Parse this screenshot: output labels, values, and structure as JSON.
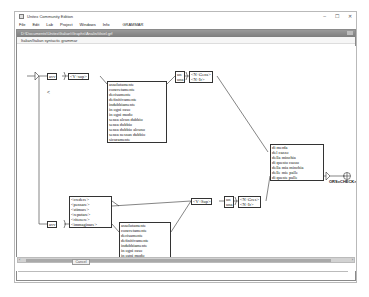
{
  "app": {
    "title": "Unitex Community Edition",
    "window_controls": {
      "minimize": "–",
      "maximize": "☐",
      "close": "✕"
    }
  },
  "menubar": {
    "items": [
      "File",
      "Edit",
      "Lab",
      "Project",
      "Windows",
      "Info",
      "GRAMMAR"
    ]
  },
  "frame": {
    "title": "D:\\Documents\\Unitex\\Italian\\Graphs\\Analisi\\ilsiel.grf",
    "header": "Italian/Italian syntactic grammar"
  },
  "graph": {
    "initial_left": "avv",
    "initial_left2": "avv",
    "v_sup_1": "<V+sup>",
    "adverbs_1": [
      "assolutamente",
      "concretamente",
      "decisamente",
      "definitivamente",
      "indubbiamente",
      "in ogni caso",
      "in ogni modo",
      "senza alcun dubbio",
      "senza dubbio",
      "senza dubbio alcuno",
      "senza nessun dubbio",
      "sicuramente"
    ],
    "un_una_1": [
      "un",
      "una"
    ],
    "noun_1": [
      "<N+Gens>",
      "<N+Ir>"
    ],
    "verbs_2": [
      "<credere>",
      "<pensare>",
      "<stimare>",
      "<reputare>",
      "<ritenere>",
      "<immaginare>"
    ],
    "v_sup_2": "<V+Sup>",
    "un_una_2": [
      "un",
      "una"
    ],
    "noun_2": [
      "<N+Gres>",
      "<N+Ir>"
    ],
    "adverbs_2": [
      "assolutamente",
      "concretamente",
      "decisamente",
      "definitivamente",
      "indubbiamente",
      "in ogni caso",
      "in ogni modo",
      "senza alcun dubbio",
      "senza dubbio",
      "senza dubbio alcuno",
      "senza nessun dubbio",
      "sicuramente"
    ],
    "insults": [
      "di merda",
      "del cazzo",
      "della minchia",
      "di questo cazzo",
      "della mia minchia",
      "delle mie palle",
      "di queste palle"
    ],
    "output_label": "ORS=CHECK>"
  },
  "bottom": {
    "cancel_label": "Cancel"
  }
}
